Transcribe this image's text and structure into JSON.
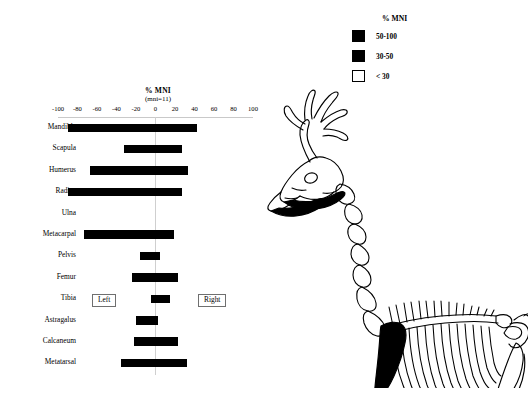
{
  "chart_data": {
    "type": "bar",
    "orientation": "horizontal-diverging",
    "title": "% MNI",
    "subtitle": "(mni=11)",
    "xlabel": "",
    "ylabel": "",
    "xlim": [
      -100,
      100
    ],
    "xticks": [
      -100,
      -80,
      -60,
      -40,
      -20,
      0,
      20,
      40,
      60,
      80,
      100
    ],
    "xtick_labels": [
      "-100",
      "-80",
      "-60",
      "-40",
      "-20",
      "0",
      "20",
      "40",
      "60",
      "80",
      "100"
    ],
    "grid": false,
    "legend_position": "top-right",
    "categories": [
      "Mandible",
      "Scapula",
      "Humerus",
      "Radius",
      "Ulna",
      "Metacarpal",
      "Pelvis",
      "Femur",
      "Tibia",
      "Astragalus",
      "Calcaneum",
      "Metatarsal"
    ],
    "series": [
      {
        "name": "Left",
        "side": "left",
        "values": [
          -90,
          -32,
          -67,
          -90,
          0,
          -73,
          -16,
          -24,
          -5,
          -20,
          -22,
          -35
        ]
      },
      {
        "name": "Right",
        "side": "right",
        "values": [
          43,
          27,
          33,
          27,
          0,
          19,
          5,
          23,
          15,
          3,
          23,
          32
        ]
      }
    ],
    "annotations": [
      {
        "label": "Left",
        "x": -62,
        "y": "Tibia"
      },
      {
        "label": "Right",
        "x": 48,
        "y": "Tibia"
      }
    ],
    "bar_color": "#000000"
  },
  "legend": {
    "title": "% MNI",
    "items": [
      {
        "label": "50-100",
        "swatch": "filled",
        "color": "#000000"
      },
      {
        "label": "30-50",
        "swatch": "filled",
        "color": "#000000"
      },
      {
        "label": "< 30",
        "swatch": "hollow",
        "color": "#ffffff"
      }
    ]
  },
  "skeleton": {
    "name": "deer-skeleton-diagram",
    "shaded_elements": [
      "mandible",
      "scapula",
      "humerus",
      "radius",
      "metacarpal",
      "metatarsal"
    ]
  }
}
